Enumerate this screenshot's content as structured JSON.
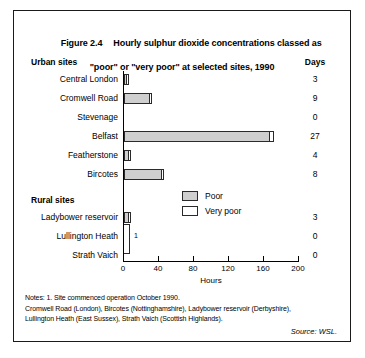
{
  "figure": {
    "number": "Figure 2.4",
    "title_line_1": "Hourly sulphur dioxide concentrations classed as",
    "title_line_2": "\"poor\" or \"very poor\" at selected sites, 1990"
  },
  "columns": {
    "urban_header": "Urban sites",
    "rural_header": "Rural sites",
    "days_header": "Days"
  },
  "legend": {
    "poor": "Poor",
    "very_poor": "Very poor"
  },
  "axis": {
    "x_title": "Hours",
    "ticks": [
      "0",
      "40",
      "80",
      "120",
      "160",
      "200"
    ]
  },
  "annotations": {
    "zero_bracket_note": "1"
  },
  "notes": {
    "line_1": "Notes: 1. Site commenced operation October 1990.",
    "line_2": "Cromwell Road (London), Bircotes (Nottinghamshire), Ladybower reservoir (Derbyshire),",
    "line_3": "Lullington Heath (East Sussex), Strath Vaich (Scottish Highlands).",
    "source": "Source: WSL."
  },
  "colors": {
    "poor_fill": "#cfcfcf",
    "very_poor_fill": "#ffffff",
    "outline": "#2a2a2a",
    "frame": "#1a1a1a"
  },
  "chart_data": {
    "type": "bar",
    "title": "Hourly sulphur dioxide concentrations classed as \"poor\" or \"very poor\" at selected sites, 1990",
    "xlabel": "Hours",
    "ylabel": "",
    "xlim": [
      0,
      200
    ],
    "xticks": [
      0,
      40,
      80,
      120,
      160,
      200
    ],
    "grid": false,
    "orientation": "horizontal",
    "legend_position": "inside-center",
    "groups": [
      {
        "name": "Urban sites",
        "categories": [
          "Central London",
          "Cromwell Road",
          "Stevenage",
          "Belfast",
          "Featherstone",
          "Bircotes"
        ],
        "poor_hours": [
          2,
          28,
          0,
          166,
          4,
          42
        ],
        "very_poor_hours": [
          2,
          3,
          0,
          5,
          2,
          3
        ],
        "days": [
          "3",
          "9",
          "0",
          "27",
          "4",
          "8"
        ]
      },
      {
        "name": "Rural sites",
        "categories": [
          "Ladybower reservoir",
          "Lullington Heath",
          "Strath Vaich"
        ],
        "poor_hours": [
          4,
          0,
          0
        ],
        "very_poor_hours": [
          3,
          0,
          0
        ],
        "days": [
          "3",
          "0",
          "0"
        ]
      }
    ],
    "series": [
      {
        "name": "Poor",
        "color": "#cfcfcf"
      },
      {
        "name": "Very poor",
        "color": "#ffffff"
      }
    ]
  }
}
